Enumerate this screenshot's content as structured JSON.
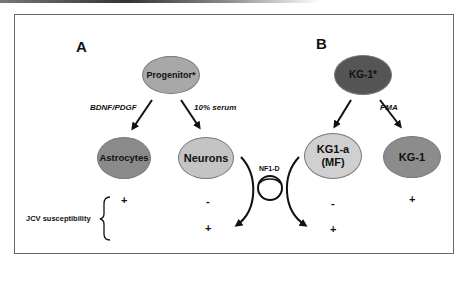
{
  "panels": {
    "a": {
      "label": "A",
      "root": {
        "label": "Progenitor*",
        "color": "#a8a8a8"
      },
      "children": [
        {
          "label": "Astrocytes",
          "color": "#8a8a8a",
          "treatment": "BDNF/PDGF",
          "jcv": [
            "+"
          ]
        },
        {
          "label": "Neurons",
          "color": "#c4c4c4",
          "treatment": "10% serum",
          "jcv": [
            "-",
            "+"
          ]
        }
      ]
    },
    "b": {
      "label": "B",
      "root": {
        "label": "KG-1*",
        "color": "#555555"
      },
      "children": [
        {
          "label_line1": "KG1-a",
          "label_line2": "(MF)",
          "color": "#d0d0d0",
          "treatment": "",
          "jcv": [
            "-",
            "+"
          ]
        },
        {
          "label": "KG-1",
          "color": "#8c8c8c",
          "treatment": "PMA",
          "jcv": [
            "+"
          ]
        }
      ]
    }
  },
  "plasmid": {
    "label": "NF1-D"
  },
  "row_label": "JCV susceptibility"
}
